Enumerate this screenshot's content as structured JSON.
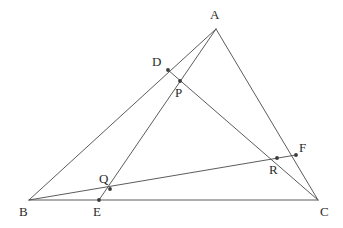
{
  "figure": {
    "type": "euclidean-geometry-diagram",
    "background_color": "#ffffff",
    "line_color": "#4a4a4a",
    "label_color": "#2b2b2b",
    "point_color": "#3a3a3a",
    "canvas": {
      "width": 343,
      "height": 228
    }
  },
  "points": [
    {
      "id": "A",
      "label": "A",
      "x": 216,
      "y": 29,
      "label_x": 210,
      "label_y": 8,
      "dot": false,
      "role": "triangle-vertex"
    },
    {
      "id": "B",
      "label": "B",
      "x": 29,
      "y": 200,
      "label_x": 19,
      "label_y": 205,
      "dot": false,
      "role": "triangle-vertex"
    },
    {
      "id": "C",
      "label": "C",
      "x": 318,
      "y": 200,
      "label_x": 320,
      "label_y": 205,
      "dot": false,
      "role": "triangle-vertex"
    },
    {
      "id": "D",
      "label": "D",
      "x": 168,
      "y": 70,
      "label_x": 152,
      "label_y": 55,
      "dot": true,
      "role": "point-on-side-AB"
    },
    {
      "id": "E",
      "label": "E",
      "x": 99,
      "y": 200,
      "label_x": 93,
      "label_y": 205,
      "dot": true,
      "role": "point-on-side-BC"
    },
    {
      "id": "F",
      "label": "F",
      "x": 296,
      "y": 155,
      "label_x": 299,
      "label_y": 141,
      "dot": true,
      "role": "point-on-side-AC"
    },
    {
      "id": "P",
      "label": "P",
      "x": 180,
      "y": 81,
      "label_x": 175,
      "label_y": 86,
      "dot": true,
      "role": "cevian-intersection"
    },
    {
      "id": "Q",
      "label": "Q",
      "x": 110,
      "y": 189,
      "label_x": 99,
      "label_y": 172,
      "dot": true,
      "role": "cevian-intersection"
    },
    {
      "id": "R",
      "label": "R",
      "x": 277,
      "y": 158,
      "label_x": 269,
      "label_y": 163,
      "dot": true,
      "role": "cevian-intersection"
    }
  ],
  "segments": [
    {
      "id": "side-AB",
      "from": "A",
      "to": "B",
      "kind": "triangle-side"
    },
    {
      "id": "side-BC",
      "from": "B",
      "to": "C",
      "kind": "triangle-side"
    },
    {
      "id": "side-CA",
      "from": "C",
      "to": "A",
      "kind": "triangle-side"
    },
    {
      "id": "cevian-AE",
      "from": "A",
      "to": "E",
      "kind": "cevian",
      "passes_through": [
        "P",
        "Q"
      ]
    },
    {
      "id": "cevian-BF",
      "from": "B",
      "to": "F",
      "kind": "cevian",
      "passes_through": [
        "Q",
        "R"
      ]
    },
    {
      "id": "cevian-CD",
      "from": "C",
      "to": "D",
      "kind": "cevian",
      "passes_through": [
        "R",
        "P"
      ]
    }
  ]
}
